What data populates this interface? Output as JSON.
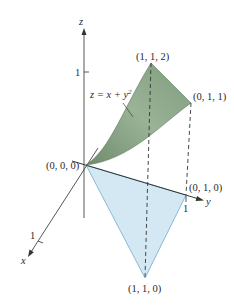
{
  "figure": {
    "type": "3d-surface-region-diagram",
    "axes": {
      "x_label": "x",
      "y_label": "y",
      "z_label": "z",
      "x_tick": "1",
      "y_tick": "1",
      "z_tick": "1"
    },
    "surface": {
      "equation_lhs": "z = x + y",
      "equation_exponent": "2",
      "color": "#8fa88a"
    },
    "base_region": {
      "color": "#cfe6f2"
    },
    "points": {
      "origin": "(0, 0, 0)",
      "p112": "(1, 1, 2)",
      "p011": "(0, 1, 1)",
      "p010": "(0, 1, 0)",
      "p110": "(1, 1, 0)"
    }
  }
}
